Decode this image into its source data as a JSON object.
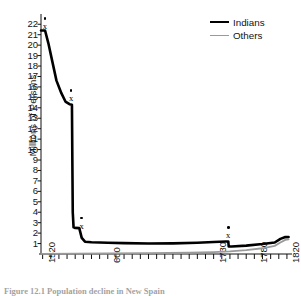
{
  "chart_data": {
    "type": "line",
    "title": "",
    "caption": "Figure 12.1   Population decline in New Spain",
    "xlabel": "",
    "ylabel": "Millions of Persons",
    "xlim": [
      1518,
      1825
    ],
    "ylim": [
      0,
      22.6
    ],
    "grid": false,
    "legend_position": "top-right",
    "y_ticks": [
      1,
      2,
      3,
      4,
      5,
      6,
      7,
      8,
      9,
      10,
      11,
      12,
      13,
      14,
      15,
      16,
      17,
      18,
      19,
      20,
      21,
      22
    ],
    "x_ticks": [
      1520,
      1600,
      1730,
      1780,
      1820
    ],
    "x_tick_labels": [
      "1520",
      "600",
      "1730",
      "1780",
      "1820"
    ],
    "x_minor_tick_step": 10,
    "series": [
      {
        "name": "Indians",
        "color": "#000000",
        "width": 2.6,
        "points": [
          [
            1518,
            21.4
          ],
          [
            1523,
            21.4
          ],
          [
            1527,
            20.2
          ],
          [
            1532,
            18.4
          ],
          [
            1537,
            16.6
          ],
          [
            1543,
            15.4
          ],
          [
            1548,
            14.6
          ],
          [
            1553,
            14.35
          ],
          [
            1556,
            14.3
          ],
          [
            1556.5,
            9.0
          ],
          [
            1557,
            4.0
          ],
          [
            1558,
            2.55
          ],
          [
            1560,
            2.5
          ],
          [
            1565,
            2.48
          ],
          [
            1568,
            1.55
          ],
          [
            1572,
            1.18
          ],
          [
            1580,
            1.12
          ],
          [
            1600,
            1.08
          ],
          [
            1620,
            1.04
          ],
          [
            1650,
            1.0
          ],
          [
            1680,
            1.02
          ],
          [
            1710,
            1.08
          ],
          [
            1730,
            1.15
          ],
          [
            1745,
            1.2
          ],
          [
            1748,
            1.2
          ],
          [
            1748.5,
            0.72
          ],
          [
            1752,
            0.72
          ],
          [
            1770,
            0.8
          ],
          [
            1790,
            0.95
          ],
          [
            1805,
            1.1
          ],
          [
            1812,
            1.45
          ],
          [
            1818,
            1.62
          ],
          [
            1822,
            1.63
          ]
        ]
      },
      {
        "name": "Others",
        "color": "#9a9a9a",
        "width": 1.8,
        "points": [
          [
            1518,
            0.02
          ],
          [
            1560,
            0.03
          ],
          [
            1600,
            0.05
          ],
          [
            1650,
            0.08
          ],
          [
            1700,
            0.12
          ],
          [
            1730,
            0.18
          ],
          [
            1750,
            0.25
          ],
          [
            1770,
            0.38
          ],
          [
            1790,
            0.55
          ],
          [
            1805,
            0.78
          ],
          [
            1812,
            1.1
          ],
          [
            1818,
            1.35
          ],
          [
            1822,
            1.4
          ]
        ]
      }
    ],
    "annotations": [
      {
        "label": "x",
        "x": 1523,
        "y": 22.0,
        "dot": true
      },
      {
        "label": "x",
        "x": 1555,
        "y": 15.1,
        "dot": true
      },
      {
        "label": "x",
        "x": 1568,
        "y": 2.9,
        "dot": true
      },
      {
        "label": "x",
        "x": 1748,
        "y": 2.0,
        "dot": true
      }
    ]
  },
  "legend": {
    "items": [
      {
        "label": "Indians"
      },
      {
        "label": "Others"
      }
    ]
  }
}
